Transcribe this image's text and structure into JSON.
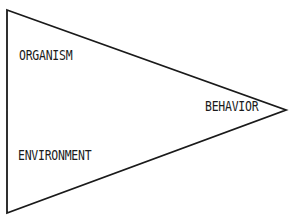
{
  "diagram": {
    "shape": "triangle",
    "vertices": {
      "top_left": [
        7,
        10
      ],
      "bottom_left": [
        7,
        213
      ],
      "apex_right": [
        286,
        110
      ]
    },
    "stroke_color": "#1a1a1a",
    "background_color": "#ffffff",
    "labels": [
      {
        "id": "organism",
        "text": "ORGANISM"
      },
      {
        "id": "behavior",
        "text": "BEHAVIOR"
      },
      {
        "id": "environment",
        "text": "ENVIRONMENT"
      }
    ]
  }
}
